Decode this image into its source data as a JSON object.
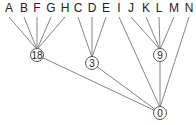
{
  "diagram": {
    "type": "tree",
    "leaves": [
      {
        "id": "A",
        "label": "A",
        "x": 9,
        "y": 12,
        "parent": "n18"
      },
      {
        "id": "B",
        "label": "B",
        "x": 24,
        "y": 12,
        "parent": "n18"
      },
      {
        "id": "F",
        "label": "F",
        "x": 37,
        "y": 12,
        "parent": "n18"
      },
      {
        "id": "G",
        "label": "G",
        "x": 51,
        "y": 12,
        "parent": "n18"
      },
      {
        "id": "H",
        "label": "H",
        "x": 65,
        "y": 12,
        "parent": "n18"
      },
      {
        "id": "C",
        "label": "C",
        "x": 78,
        "y": 12,
        "parent": "n3"
      },
      {
        "id": "D",
        "label": "D",
        "x": 92,
        "y": 12,
        "parent": "n3"
      },
      {
        "id": "E",
        "label": "E",
        "x": 106,
        "y": 12,
        "parent": "n3"
      },
      {
        "id": "I",
        "label": "I",
        "x": 119,
        "y": 12,
        "parent": "n0"
      },
      {
        "id": "J",
        "label": "J",
        "x": 131,
        "y": 12,
        "parent": "n9"
      },
      {
        "id": "K",
        "label": "K",
        "x": 146,
        "y": 12,
        "parent": "n9"
      },
      {
        "id": "L",
        "label": "L",
        "x": 159,
        "y": 12,
        "parent": "n9"
      },
      {
        "id": "M",
        "label": "M",
        "x": 174,
        "y": 12,
        "parent": "n9"
      },
      {
        "id": "N",
        "label": "N",
        "x": 189,
        "y": 12,
        "parent": "n0"
      }
    ],
    "internal_nodes": [
      {
        "id": "n18",
        "label": "18",
        "x": 37,
        "y": 55,
        "r": 6.5,
        "parent": "n0"
      },
      {
        "id": "n3",
        "label": "3",
        "x": 92,
        "y": 63,
        "r": 6.5,
        "parent": "n0"
      },
      {
        "id": "n9",
        "label": "9",
        "x": 160,
        "y": 55,
        "r": 6.5,
        "parent": "n0"
      },
      {
        "id": "n0",
        "label": "0",
        "x": 160,
        "y": 113,
        "r": 6.5,
        "parent": null
      }
    ],
    "colors": {
      "edge": "#777777",
      "node_stroke": "#555555",
      "text": "#222222",
      "background": "#ffffff"
    }
  }
}
